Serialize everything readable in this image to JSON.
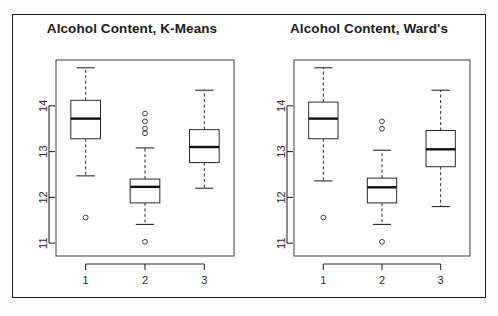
{
  "figure": {
    "background": "#fdfdfd",
    "frame_color": "#1b1b1b",
    "panels": [
      {
        "id": "kmeans",
        "title": "Alcohol Content, K-Means"
      },
      {
        "id": "wards",
        "title": "Alcohol Content, Ward's"
      }
    ]
  },
  "chart_data": [
    {
      "type": "box",
      "id": "kmeans",
      "title": "Alcohol Content, K-Means",
      "xlabel": "",
      "ylabel": "",
      "categories": [
        "1",
        "2",
        "3"
      ],
      "xticklabels": [
        "1",
        "2",
        "3"
      ],
      "yticklabels": [
        "11",
        "12",
        "13",
        "14"
      ],
      "yticks": [
        11,
        12,
        13,
        14
      ],
      "ylim": [
        10.72,
        15.0
      ],
      "grid": false,
      "legend": false,
      "boxes": [
        {
          "category": "1",
          "whisker_low": 12.47,
          "q1": 13.28,
          "median": 13.72,
          "q3": 14.12,
          "whisker_high": 14.83,
          "outliers": [
            11.56
          ]
        },
        {
          "category": "2",
          "whisker_low": 11.41,
          "q1": 11.88,
          "median": 12.23,
          "q3": 12.4,
          "whisker_high": 13.08,
          "outliers": [
            13.83,
            13.66,
            13.5,
            13.4,
            11.03
          ]
        },
        {
          "category": "3",
          "whisker_low": 12.2,
          "q1": 12.76,
          "median": 13.1,
          "q3": 13.48,
          "whisker_high": 14.34,
          "outliers": []
        }
      ]
    },
    {
      "type": "box",
      "id": "wards",
      "title": "Alcohol Content, Ward's",
      "xlabel": "",
      "ylabel": "",
      "categories": [
        "1",
        "2",
        "3"
      ],
      "xticklabels": [
        "1",
        "2",
        "3"
      ],
      "yticklabels": [
        "11",
        "12",
        "13",
        "14"
      ],
      "yticks": [
        11,
        12,
        13,
        14
      ],
      "ylim": [
        10.72,
        15.0
      ],
      "grid": false,
      "legend": false,
      "boxes": [
        {
          "category": "1",
          "whisker_low": 12.36,
          "q1": 13.28,
          "median": 13.72,
          "q3": 14.08,
          "whisker_high": 14.83,
          "outliers": [
            11.56
          ]
        },
        {
          "category": "2",
          "whisker_low": 11.41,
          "q1": 11.88,
          "median": 12.22,
          "q3": 12.42,
          "whisker_high": 13.03,
          "outliers": [
            13.66,
            13.5,
            11.03
          ]
        },
        {
          "category": "3",
          "whisker_low": 11.8,
          "q1": 12.67,
          "median": 13.05,
          "q3": 13.46,
          "whisker_high": 14.34,
          "outliers": []
        }
      ]
    }
  ]
}
